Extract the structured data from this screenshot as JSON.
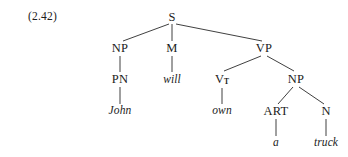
{
  "figure": {
    "example_number": "(2.42)",
    "kind": "syntax-tree",
    "sentence": "John will own a truck",
    "colors": {
      "background": "#ffffff",
      "text": "#1c1c1c",
      "line": "#2a2a2a"
    }
  },
  "tree": {
    "nodes": [
      {
        "id": "s",
        "label": "S",
        "type": "category",
        "x": 172,
        "y": 17
      },
      {
        "id": "np1",
        "label": "NP",
        "type": "category",
        "x": 120,
        "y": 48
      },
      {
        "id": "m",
        "label": "M",
        "type": "category",
        "x": 172,
        "y": 48
      },
      {
        "id": "vp",
        "label": "VP",
        "type": "category",
        "x": 264,
        "y": 48
      },
      {
        "id": "pn",
        "label": "PN",
        "type": "category",
        "x": 120,
        "y": 79
      },
      {
        "id": "will",
        "label": "will",
        "type": "terminal",
        "x": 172,
        "y": 80
      },
      {
        "id": "vt",
        "label": "V",
        "sub": "T",
        "type": "category",
        "x": 222,
        "y": 79
      },
      {
        "id": "np2",
        "label": "NP",
        "type": "category",
        "x": 296,
        "y": 79
      },
      {
        "id": "john",
        "label": "John",
        "type": "terminal",
        "x": 120,
        "y": 111
      },
      {
        "id": "own",
        "label": "own",
        "type": "terminal",
        "x": 222,
        "y": 111
      },
      {
        "id": "art",
        "label": "ART",
        "type": "category",
        "x": 276,
        "y": 111
      },
      {
        "id": "n",
        "label": "N",
        "type": "category",
        "x": 326,
        "y": 111
      },
      {
        "id": "a",
        "label": "a",
        "type": "terminal",
        "x": 276,
        "y": 143
      },
      {
        "id": "truck",
        "label": "truck",
        "type": "terminal",
        "x": 326,
        "y": 143
      }
    ],
    "edges": [
      {
        "from": "s",
        "to": "np1",
        "x1": 169,
        "y1": 24,
        "x2": 123,
        "y2": 41
      },
      {
        "from": "s",
        "to": "m",
        "x1": 172,
        "y1": 24,
        "x2": 172,
        "y2": 41
      },
      {
        "from": "s",
        "to": "vp",
        "x1": 176,
        "y1": 24,
        "x2": 262,
        "y2": 41
      },
      {
        "from": "np1",
        "to": "pn",
        "x1": 120,
        "y1": 56,
        "x2": 120,
        "y2": 72
      },
      {
        "from": "m",
        "to": "will",
        "x1": 172,
        "y1": 56,
        "x2": 172,
        "y2": 72
      },
      {
        "from": "pn",
        "to": "john",
        "x1": 120,
        "y1": 87,
        "x2": 120,
        "y2": 104
      },
      {
        "from": "vp",
        "to": "vt",
        "x1": 261,
        "y1": 56,
        "x2": 224,
        "y2": 71
      },
      {
        "from": "vp",
        "to": "np2",
        "x1": 267,
        "y1": 56,
        "x2": 294,
        "y2": 71
      },
      {
        "from": "vt",
        "to": "own",
        "x1": 222,
        "y1": 88,
        "x2": 222,
        "y2": 104
      },
      {
        "from": "np2",
        "to": "art",
        "x1": 293,
        "y1": 87,
        "x2": 278,
        "y2": 104
      },
      {
        "from": "np2",
        "to": "n",
        "x1": 299,
        "y1": 87,
        "x2": 324,
        "y2": 104
      },
      {
        "from": "art",
        "to": "a",
        "x1": 276,
        "y1": 119,
        "x2": 276,
        "y2": 136
      },
      {
        "from": "n",
        "to": "truck",
        "x1": 326,
        "y1": 119,
        "x2": 326,
        "y2": 136
      }
    ]
  }
}
